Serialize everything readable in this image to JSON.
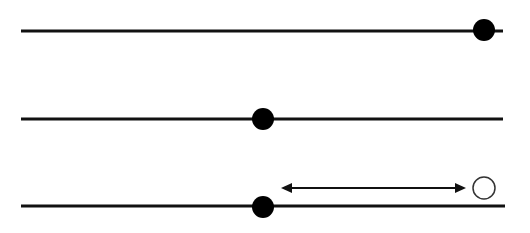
{
  "diagram": {
    "background": "#ffffff",
    "stroke_color": "#111111",
    "lines": [
      {
        "id": "line-1",
        "x1": 21,
        "x2": 503,
        "y": 31,
        "width": 3
      },
      {
        "id": "line-2",
        "x1": 21,
        "x2": 503,
        "y": 119,
        "width": 3
      },
      {
        "id": "line-3",
        "x1": 21,
        "x2": 505,
        "y": 206,
        "width": 3
      }
    ],
    "filled_dots": [
      {
        "id": "dot-1",
        "cx": 484,
        "cy": 30,
        "r": 11
      },
      {
        "id": "dot-2",
        "cx": 263,
        "cy": 119,
        "r": 11
      },
      {
        "id": "dot-3",
        "cx": 263,
        "cy": 207,
        "r": 11
      }
    ],
    "open_circle": {
      "cx": 484,
      "cy": 188,
      "r": 11
    },
    "double_arrow": {
      "x1": 281,
      "x2": 466,
      "y": 188,
      "width": 2
    }
  }
}
